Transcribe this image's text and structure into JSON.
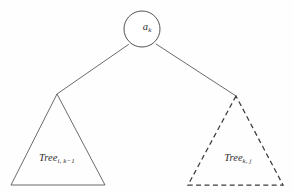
{
  "figure": {
    "kind": "binary-tree-decomposition-diagram",
    "background_color": "#fefefe",
    "stroke_color": "#4a4a4a",
    "text_color": "#2b2b2b",
    "width": 294,
    "height": 194
  },
  "root_node": {
    "shape": "circle",
    "label_base": "a",
    "label_subscript": "k",
    "label_full": "a_k",
    "cx": 142,
    "cy": 29,
    "r": 18,
    "line_style": "solid"
  },
  "edges": [
    {
      "name": "edge-root-to-left-subtree",
      "from": {
        "x": 128.5,
        "y": 44.5
      },
      "to": {
        "x": 57,
        "y": 94
      },
      "line_style": "solid"
    },
    {
      "name": "edge-root-to-right-subtree",
      "from": {
        "x": 156,
        "y": 44
      },
      "to": {
        "x": 236,
        "y": 96
      },
      "line_style": "solid"
    }
  ],
  "subtrees": [
    {
      "name": "left-subtree",
      "label_base": "Tree",
      "label_subscript": "i, k−1",
      "label_full": "Tree_{i, k-1}",
      "line_style": "solid",
      "apex": {
        "x": 57,
        "y": 94
      },
      "base_left": {
        "x": 11,
        "y": 185
      },
      "base_right": {
        "x": 105,
        "y": 185
      },
      "label_position": {
        "x": 57,
        "y": 158
      }
    },
    {
      "name": "right-subtree",
      "label_base": "Tree",
      "label_subscript": "k, j",
      "label_full": "Tree_{k, j}",
      "line_style": "dashed",
      "apex": {
        "x": 236,
        "y": 96
      },
      "base_left": {
        "x": 188,
        "y": 185
      },
      "base_right": {
        "x": 283,
        "y": 185
      },
      "label_position": {
        "x": 238,
        "y": 158
      }
    }
  ]
}
